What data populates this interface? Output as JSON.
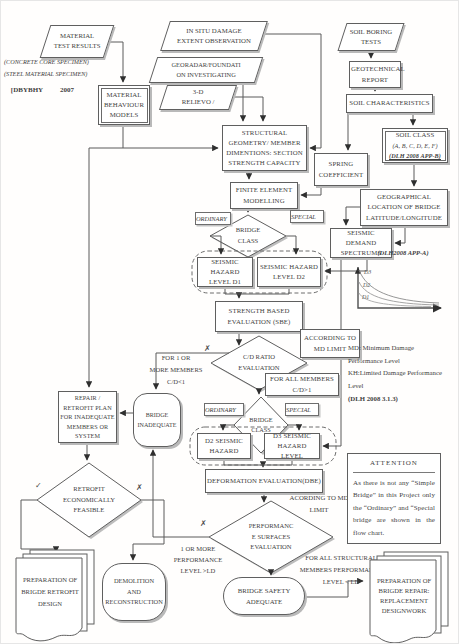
{
  "colors": {
    "ink": "#3f3f3f",
    "line": "#5f5f5f",
    "shadow": "#b9b9b9",
    "paper": "#fffefd"
  },
  "nodes": {
    "material_test": "MATERIAL\nTEST RESULTS",
    "specimen_note": "(CONCRETE CORE SPECIMEN)\n(STEEL MATERIAL SPECIMEN)",
    "dbybhy_left": "[DBYBHY",
    "dbybhy_right": "2007",
    "material_models": "MATERIAL\nBEHAVIOUR\nMODELS",
    "in_situ": "IN SITU DAMAGE\nEXTENT OBSERVATION",
    "georadar": "GEORADAR/FOUNDATI\nON INVESTIGATING",
    "relievo": "3-D\nRELIEVO /",
    "soil_boring": "SOIL BORING\nTESTS",
    "geotechnical": "GEOTECHNICAL\nREPORT",
    "soil_characteristics": "SOIL CHARACTERISTICS",
    "soil_class_title": "SOIL CLASS",
    "soil_class_classes": "(A, B, C, D, E, F)",
    "soil_class_ref": "(DLH 2008 APP-B)",
    "structural": "STRUCTURAL\nGEOMETRY/ MEMBER\nDIMENTIONS: SECTION\nSTRENGTH CAPACITY",
    "spring": "SPRING\nCOEFFICIENT",
    "fem": "FINITE ELEMENT\nMODELLING",
    "geo_location": "GEOGRAPHICAL\nLOCATION OF BRIDGE\nLATITUDE/LONGITUDE",
    "spectrums": "SEISMIC DEMAND\nSPECTRUMS",
    "dlh_app_a": "(DLH2008 APP-A)",
    "ordinary1": "ORDINARY",
    "special1": "SPECIAL",
    "bridge_class1": "BRIDGE\nCLASS",
    "shl_d1": "SEISMIC HAZARD\nLEVEL D1",
    "shl_d2": "SEISMIC HAZARD\nLEVEL D2",
    "sbe": "STRENGTH BASED\nEVALUATION (SBE)",
    "according_box": "ACCORDING TO\nMD LIMIT",
    "cd_ratio": "C/D RATIO\nEVALUATION",
    "md_note": "MD: Minimum Damage\nPerformance Level\nKH:Limited Damage Performance\nLevel",
    "md_note_ref": "(DLH 2008 3.1.3)",
    "for_one_or_more": "FOR 1 OR\nMORE MEMBERS\nC/D<1",
    "for_all_members": "FOR ALL MEMBERS\nC/D>1",
    "bridge_inadequate": "BRIDGE\nINADEQUATE",
    "repair_plan": "REPAIR /\nRETROFIT PLAN\nFOR INADEQUATE\nMEMBERS OR\nSYSTEM",
    "ordinary2": "ORDINARY",
    "special2": "SPECIAL",
    "bridge_class2": "BRIDGE\nCLASS",
    "d2_hazard": "D2 SEISMIC\nHAZARD",
    "d3_hazard": "D3 SEISMIC\nHAZARD LEVEL",
    "deformation": "DEFORMATION EVALUATION(DBE)",
    "according_text": "ACORDING TO MD\nLIMIT",
    "attention_title": "ATTENTION",
    "attention_body": "As there is not any “Simple Bridge” in this Project only the “Ordinary” and “Special bridge are shown in the flow chart.",
    "retrofit_feasible": "RETROFIT\nECONOMICALLY\nFEASIBLE",
    "performance_surfaces": "PERFORMANC\nE SURFACES\nEVALUATION",
    "one_or_more_level": "1 OR MORE\nPERFORMANCE\nLEVEL >LD",
    "for_all_structural": "FOR ALL STRUCTURAL\nMEMBERS PERFORMANCE\nLEVEL < LD",
    "prep_retrofit": "PREPARATION\nOF BRIGDE\nRETROFIT DESIGN",
    "demolition": "DEMOLITION\nAND\nRECONSTRUCTION",
    "bridge_safety": "BRIDGE SAFETY\nADEQUATE",
    "prep_repair": "PREPARATION\nOF BRIGDE\nREPAIR:\nREPLACEMENT\nDESIGNWORK",
    "check_mark": "✓",
    "cross_mark": "✗"
  },
  "spectrum_graph": {
    "type": "line",
    "curves": [
      "D3",
      "D2",
      "D1"
    ],
    "note_label": "(DLH2008 APP-A)",
    "description": "Seismic demand spectra, decaying curves D3 above D2 above D1"
  }
}
